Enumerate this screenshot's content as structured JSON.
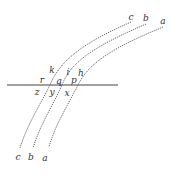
{
  "diagram": {
    "line_colors": {
      "curve": "#555555",
      "surface": "#444444"
    },
    "surface_line": {
      "x1": 7,
      "y1": 85,
      "x2": 118,
      "y2": 85
    },
    "curves": [
      {
        "id": "a",
        "path": "M163,27 C120,45 90,60 78,85 C68,105 55,125 49,147"
      },
      {
        "id": "b",
        "path": "M146,24 C105,42 72,58 62,85 C53,105 40,125 33,148"
      },
      {
        "id": "c",
        "path": "M131,22 C95,38 62,55 50,85 C40,105 27,125 20,148"
      }
    ],
    "labels": {
      "top_c": {
        "text": "c",
        "x": 131,
        "y": 17
      },
      "top_b": {
        "text": "b",
        "x": 146,
        "y": 18
      },
      "top_a": {
        "text": "a",
        "x": 163,
        "y": 21
      },
      "k": {
        "text": "k",
        "x": 52,
        "y": 70
      },
      "i": {
        "text": "i",
        "x": 68,
        "y": 72
      },
      "h": {
        "text": "h",
        "x": 81,
        "y": 73
      },
      "r": {
        "text": "r",
        "x": 42,
        "y": 80
      },
      "q": {
        "text": "q",
        "x": 59,
        "y": 81
      },
      "p": {
        "text": "p",
        "x": 74,
        "y": 80
      },
      "z": {
        "text": "z",
        "x": 37,
        "y": 92
      },
      "y": {
        "text": "y",
        "x": 52,
        "y": 92
      },
      "x": {
        "text": "x",
        "x": 67,
        "y": 93
      },
      "bottom_c": {
        "text": "c",
        "x": 18,
        "y": 157
      },
      "bottom_b": {
        "text": "b",
        "x": 31,
        "y": 157
      },
      "bottom_a": {
        "text": "a",
        "x": 45,
        "y": 158
      }
    }
  }
}
